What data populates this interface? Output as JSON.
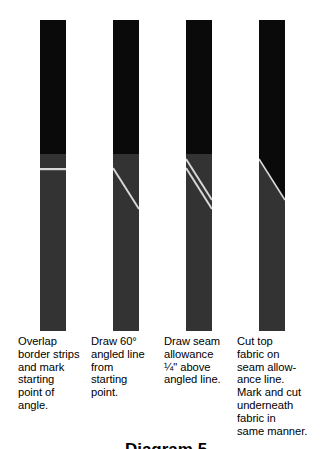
{
  "figure": {
    "label": "Diagram 5",
    "background_color": "#ffffff",
    "colors": {
      "top_fabric": "#0a0a0a",
      "bottom_fabric": "#333333",
      "mark_line": "#d8d8d8",
      "text": "#000000"
    }
  },
  "panels": [
    {
      "id": "panel-1",
      "step_number": 1,
      "caption": "Overlap\nborder strips\nand mark\nstarting\npoint of\nangle.",
      "illustration": {
        "name": "overlapped-border-strips-with-horizontal-mark",
        "top_fabric_extent_pct": 43,
        "marks": [
          {
            "type": "horizontal-line",
            "name": "starting-point-mark",
            "y_pct": 48,
            "color": "#d8d8d8"
          }
        ]
      }
    },
    {
      "id": "panel-2",
      "step_number": 2,
      "caption": "Draw 60°\nangled line\nfrom\nstarting\npoint.",
      "illustration": {
        "name": "border-strips-with-60-degree-angled-line",
        "top_fabric_extent_pct": 43,
        "marks": [
          {
            "type": "diagonal-line",
            "name": "angled-line",
            "x1_pct": 0,
            "y1_pct": 48,
            "x2_pct": 100,
            "y2_pct": 61,
            "color": "#d8d8d8"
          }
        ]
      }
    },
    {
      "id": "panel-3",
      "step_number": 3,
      "caption": "Draw seam\nallowance\n¼\" above\nangled line.",
      "caption_parts": {
        "line3_fraction_numerator": "1",
        "line3_fraction_denominator": "4",
        "line3_rest": "\" above"
      },
      "illustration": {
        "name": "border-strips-with-seam-allowance-line",
        "top_fabric_extent_pct": 43,
        "marks": [
          {
            "type": "diagonal-line",
            "name": "seam-allowance-line",
            "x1_pct": 0,
            "y1_pct": 45,
            "x2_pct": 100,
            "y2_pct": 58,
            "color": "#d8d8d8"
          },
          {
            "type": "diagonal-line",
            "name": "angled-line",
            "x1_pct": 0,
            "y1_pct": 48,
            "x2_pct": 100,
            "y2_pct": 61,
            "color": "#d8d8d8"
          }
        ]
      }
    },
    {
      "id": "panel-4",
      "step_number": 4,
      "caption": "Cut top\nfabric on\nseam allow-\nance line.\nMark and cut\nunderneath\nfabric in\nsame manner.",
      "illustration": {
        "name": "top-fabric-cut-on-seam-allowance-line",
        "top_fabric_extent_pct": 43,
        "marks": [
          {
            "type": "diagonal-cut-edge",
            "name": "cut-edge",
            "x1_pct": 0,
            "y1_pct": 45,
            "x2_pct": 100,
            "y2_pct": 58,
            "color": "#d8d8d8"
          }
        ]
      }
    }
  ]
}
